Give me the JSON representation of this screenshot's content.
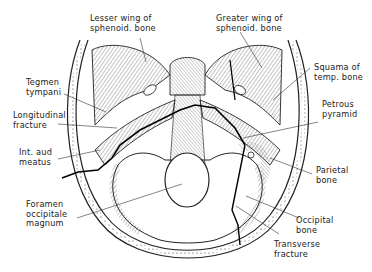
{
  "figure": {
    "labels": {
      "lesser_wing": "Lesser wing of\nsphenoid. bone",
      "greater_wing": "Greater wing of\nsphenoid. bone",
      "squama": "Squama of\ntemp. bone",
      "tegmen": "Tegmen\ntympani",
      "longitudinal": "Longitudinal\nfracture",
      "petrous": "Petrous\npyramid",
      "int_aud": "Int. aud\nmeatus",
      "parietal": "Parietal\nbone",
      "foramen": "Foramen\noccipitale\nmagnum",
      "occipital": "Occipital\nbone",
      "transverse": "Transverse\nfracture"
    },
    "colors": {
      "ink": "#1a1a1a",
      "shade": "#8a8a8a",
      "paper": "#ffffff"
    }
  }
}
